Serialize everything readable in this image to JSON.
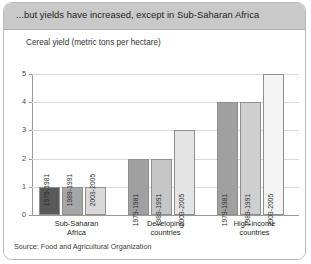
{
  "panel": {
    "title": "...but yields have increased, except in Sub-Saharan Africa",
    "source": "Source: Food and Agricultural Organization"
  },
  "chart_data": {
    "type": "bar",
    "title": "Cereal yield (metric tons per hectare)",
    "xlabel": "",
    "ylabel": "",
    "ylim": [
      0,
      5
    ],
    "yticks": [
      "0",
      "1",
      "2",
      "3",
      "4",
      "5"
    ],
    "grid": true,
    "legend": "none",
    "categories": [
      "Sub-Saharan Africa",
      "Developing countries",
      "High-income countries"
    ],
    "series": [
      {
        "name": "1979-1981",
        "color": "#595959",
        "values": [
          1,
          2,
          4
        ]
      },
      {
        "name": "1989-1991",
        "color": "#a6a6a6",
        "values": [
          1,
          2,
          4
        ]
      },
      {
        "name": "2003-2005",
        "color": "#d9d9d9",
        "values": [
          1,
          3,
          5
        ]
      }
    ],
    "bars": [
      {
        "group": 0,
        "series": 0,
        "label": "1979-1981",
        "value": 1,
        "color": "#595959",
        "label_inside": false
      },
      {
        "group": 0,
        "series": 1,
        "label": "1989-1991",
        "value": 1,
        "color": "#a6a6a6",
        "label_inside": false
      },
      {
        "group": 0,
        "series": 2,
        "label": "2003-2005",
        "value": 1,
        "color": "#d9d9d9",
        "label_inside": false
      },
      {
        "group": 1,
        "series": 0,
        "label": "1979-1981",
        "value": 2,
        "color": "#a0a0a0",
        "label_inside": true
      },
      {
        "group": 1,
        "series": 1,
        "label": "1989-1991",
        "value": 2,
        "color": "#c6c6c6",
        "label_inside": true
      },
      {
        "group": 1,
        "series": 2,
        "label": "2003-2005",
        "value": 3,
        "color": "#e4e4e4",
        "label_inside": true
      },
      {
        "group": 2,
        "series": 0,
        "label": "1979-1981",
        "value": 4,
        "color": "#a0a0a0",
        "label_inside": true
      },
      {
        "group": 2,
        "series": 1,
        "label": "1989-1991",
        "value": 4,
        "color": "#cfcfcf",
        "label_inside": true
      },
      {
        "group": 2,
        "series": 2,
        "label": "2003-2005",
        "value": 5,
        "color": "#f4f4f4",
        "label_inside": true
      }
    ],
    "category_lines": [
      [
        "Sub-Saharan",
        "Africa"
      ],
      [
        "Developing",
        "countries"
      ],
      [
        "High-income",
        "countries"
      ]
    ]
  }
}
